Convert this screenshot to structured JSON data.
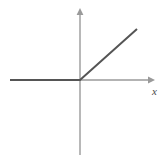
{
  "figure": {
    "name": "piecewise-linear-function-graph",
    "background_color": "#ffffff",
    "width": 166,
    "height": 163
  },
  "axes": {
    "x_axis": {
      "label": "x",
      "color": "#9a9a9a",
      "stroke_width": 1.4,
      "start_px": [
        10,
        80
      ],
      "end_px": [
        155,
        80
      ],
      "arrow": "right"
    },
    "y_axis": {
      "label": "",
      "color": "#9a9a9a",
      "stroke_width": 1.4,
      "start_px": [
        80,
        155
      ],
      "end_px": [
        80,
        8
      ],
      "arrow": "up"
    },
    "origin_px": [
      80,
      80
    ],
    "grid": "off",
    "tick_labels": []
  },
  "chart_data": {
    "type": "line",
    "title": "",
    "subtitle": "",
    "xlabel": "x",
    "ylabel": "",
    "grid": false,
    "legend_position": "none",
    "annotations": [],
    "xlim": [
      -5,
      5.4
    ],
    "ylim": [
      -5.4,
      5.4
    ],
    "series": [
      {
        "name": "piecewise-linear-relu",
        "color": "#555555",
        "stroke_width": 2,
        "x": [
          -5.0,
          0.0,
          4.1
        ],
        "y": [
          0.0,
          0.0,
          3.65
        ],
        "points_px": [
          [
            10,
            80
          ],
          [
            80,
            80
          ],
          [
            137,
            29
          ]
        ],
        "description": "Horizontal ray along negative x-axis then 45 degree rising ray"
      }
    ]
  },
  "colors": {
    "curve": "#555555",
    "axis": "#9a9a9a",
    "label": "#4a4a4a",
    "background": "#ffffff"
  }
}
